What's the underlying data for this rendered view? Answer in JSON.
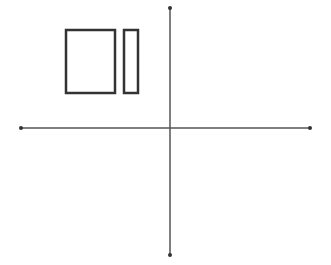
{
  "canvas": {
    "width": 331,
    "height": 265,
    "background": "#ffffff",
    "stroke": "#333333"
  },
  "axes": {
    "vertical": {
      "x": 170,
      "y1": 8,
      "y2": 255
    },
    "horizontal": {
      "y": 128,
      "x1": 21,
      "x2": 310
    },
    "endpoint_radius": 2
  },
  "shapes": [
    {
      "name": "large-rectangle",
      "x": 66,
      "y": 30,
      "width": 49,
      "height": 63
    },
    {
      "name": "small-rectangle",
      "x": 124,
      "y": 30,
      "width": 14,
      "height": 63
    }
  ]
}
